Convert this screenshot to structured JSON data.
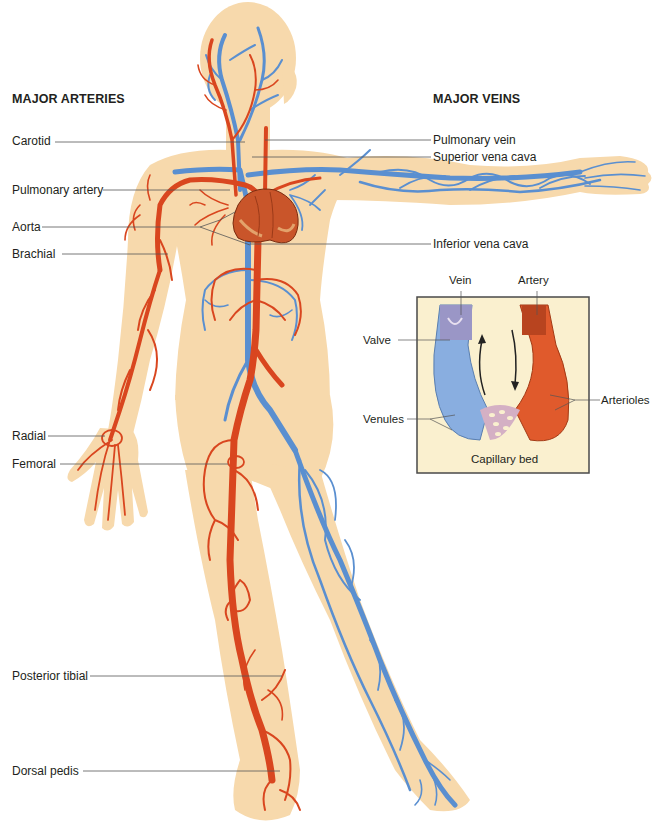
{
  "headings": {
    "arteries": "MAJOR ARTERIES",
    "veins": "MAJOR VEINS"
  },
  "artery_labels": [
    {
      "id": "carotid",
      "text": "Carotid"
    },
    {
      "id": "pulmonary-artery",
      "text": "Pulmonary artery"
    },
    {
      "id": "aorta",
      "text": "Aorta"
    },
    {
      "id": "brachial",
      "text": "Brachial"
    },
    {
      "id": "radial",
      "text": "Radial"
    },
    {
      "id": "femoral",
      "text": "Femoral"
    },
    {
      "id": "posterior-tibial",
      "text": "Posterior tibial"
    },
    {
      "id": "dorsal-pedis",
      "text": "Dorsal pedis"
    }
  ],
  "vein_labels": [
    {
      "id": "pulmonary-vein",
      "text": "Pulmonary vein"
    },
    {
      "id": "superior-vena-cava",
      "text": "Superior vena cava"
    },
    {
      "id": "inferior-vena-cava",
      "text": "Inferior vena cava"
    }
  ],
  "inset": {
    "vein": "Vein",
    "artery": "Artery",
    "valve": "Valve",
    "venules": "Venules",
    "arterioles": "Arterioles",
    "capillary_bed": "Capillary bed"
  },
  "colors": {
    "skin": "#f7d9ac",
    "artery": "#d9461f",
    "vein": "#5a8fd0",
    "heart": "#c9552a",
    "inset_bg": "#faf0cf",
    "leader_line": "#555555"
  }
}
